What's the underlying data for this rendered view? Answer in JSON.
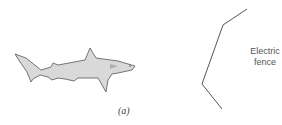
{
  "figure": {
    "caption": "(a)",
    "fence_label_line1": "Electric",
    "fence_label_line2": "fence",
    "colors": {
      "shark_fill": "#d9d9d9",
      "shark_stroke": "#555555",
      "fence_stroke": "#555555",
      "gill_mark": "#b0b0b0"
    }
  }
}
